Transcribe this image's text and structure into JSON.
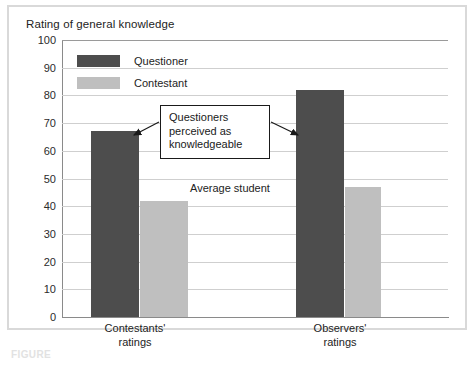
{
  "chart_data": {
    "type": "bar",
    "title": "Rating of general knowledge",
    "xlabel": "",
    "ylabel": "Rating of general knowledge",
    "ylim": [
      0,
      100
    ],
    "yticks": [
      100,
      90,
      80,
      70,
      60,
      50,
      40,
      30,
      20,
      10,
      0
    ],
    "grid": true,
    "legend_position": "top-left",
    "categories": [
      "Contestants' ratings",
      "Observers' ratings"
    ],
    "category_lines": [
      [
        "Contestants'",
        "ratings"
      ],
      [
        "Observers'",
        "ratings"
      ]
    ],
    "series": [
      {
        "name": "Questioner",
        "color": "#4d4d4d",
        "values": [
          67,
          82
        ]
      },
      {
        "name": "Contestant",
        "color": "#bfbfbf",
        "values": [
          42,
          47
        ]
      }
    ],
    "annotations": [
      {
        "name": "callout",
        "text": "Questioners perceived as knowledgeable",
        "lines": [
          "Questioners",
          "perceived as",
          "knowledgeable"
        ]
      },
      {
        "name": "average-student",
        "text": "Average student",
        "value": 50
      }
    ]
  },
  "colors": {
    "questioner": "#4d4d4d",
    "contestant": "#bfbfbf",
    "grid": "#cfcfcf",
    "axis": "#8a8a8a",
    "frame": "#d9d9d9",
    "text": "#232323"
  },
  "caption": {
    "text": "FIGURE"
  }
}
